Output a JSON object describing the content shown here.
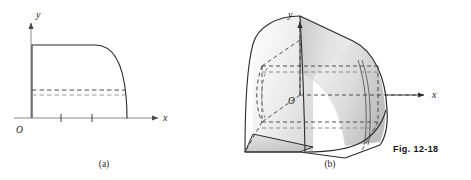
{
  "figure": {
    "number_label": "Fig. 12-18",
    "panels": [
      {
        "id": "panel-a",
        "caption": "(a)",
        "type": "2d-plot",
        "axes": {
          "x_label": "x",
          "y_label": "y",
          "origin_label": "O"
        },
        "x_tick_count": 2,
        "dashed_line_count": 2
      },
      {
        "id": "panel-b",
        "caption": "(b)",
        "type": "3d-solid",
        "axes": {
          "x_label": "x",
          "y_label": "y",
          "origin_label": "O"
        }
      }
    ]
  },
  "colors": {
    "background": "#ffffff",
    "stroke_dark": "#1a1a1a",
    "stroke_axis": "#8a8a8a",
    "dashed_gray": "#9a9a9a",
    "fill_light": "#f2f2f2",
    "fill_mid": "#d8d8d8",
    "fill_dark": "#c2c2c2"
  }
}
